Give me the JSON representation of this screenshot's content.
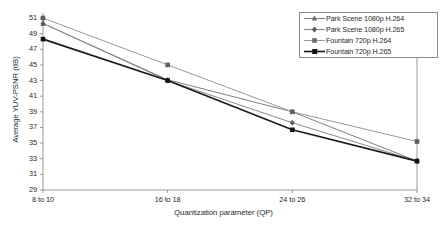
{
  "chart_data": {
    "type": "line",
    "title": "",
    "xlabel": "Quantization parameter (QP)",
    "ylabel": "Average YUV-PSNR (dB)",
    "categories": [
      "8 to 10",
      "16 to 18",
      "24 to 26",
      "32 to 34"
    ],
    "ylim": [
      29,
      51
    ],
    "yticks": [
      29,
      31,
      33,
      35,
      37,
      39,
      41,
      43,
      45,
      47,
      49,
      51
    ],
    "grid": false,
    "legend_position": "top-right",
    "series": [
      {
        "name": "Park Scene 1080p H.264",
        "values": [
          50.3,
          43.1,
          39.0,
          32.7
        ],
        "color": "#808080",
        "marker": "triangle"
      },
      {
        "name": "Park Scene 1080p H.265",
        "values": [
          50.3,
          43.0,
          37.6,
          32.7
        ],
        "color": "#8a8a8a",
        "marker": "diamond"
      },
      {
        "name": "Fountain 720p H.264",
        "values": [
          51.0,
          45.0,
          39.0,
          35.2
        ],
        "color": "#9a9a9a",
        "marker": "square"
      },
      {
        "name": "Fountain 720p H.265",
        "values": [
          48.3,
          43.0,
          36.7,
          32.7
        ],
        "color": "#1a1a1a",
        "marker": "square"
      }
    ]
  },
  "axis": {
    "ytick_labels": [
      "51",
      "49",
      "47",
      "45",
      "43",
      "41",
      "39",
      "37",
      "35",
      "33",
      "31",
      "29"
    ],
    "xtick_labels": [
      "8 to 10",
      "16 to 18",
      "24 to 26",
      "32 to 34"
    ],
    "xtitle": "Quantization parameter (QP)",
    "ytitle": "Average YUV-PSNR (dB)"
  },
  "legend": {
    "entries": [
      {
        "label": "Park Scene 1080p H.264"
      },
      {
        "label": "Park Scene 1080p H.265"
      },
      {
        "label": "Fountain 720p H.264"
      },
      {
        "label": "Fountain 720p H.265"
      }
    ]
  },
  "colors": {
    "axis": "#8c8c8c",
    "text": "#2a2a2a",
    "background": "#ffffff"
  }
}
